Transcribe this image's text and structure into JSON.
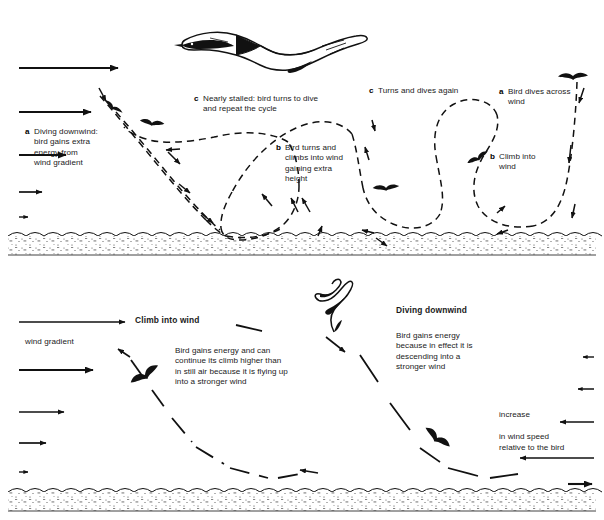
{
  "figure": {
    "title_implicit": "Dynamic soaring of an albatross",
    "ink_color": "#111111",
    "background_color": "#ffffff",
    "panels": [
      {
        "id": "top-panel",
        "name": "dynamic-soaring-cycle",
        "labels": [
          {
            "key": "a",
            "text": "Diving downwind:\nbird gains extra\nenergy from\nwind gradient"
          },
          {
            "key": "c",
            "text": "Nearly stalled: bird turns to dive\nand repeat the cycle"
          },
          {
            "key": "b",
            "text": "Bird turns and\nclimbs into wind\ngaining extra\nheight"
          },
          {
            "key": "c",
            "text": "Turns and dives again"
          },
          {
            "key": "a",
            "text": "Bird dives across\nwind"
          },
          {
            "key": "b",
            "text": "Climb into\nwind"
          }
        ],
        "wind_gradient_arrows": [
          {
            "length_px": 106,
            "label": "strongest wind"
          },
          {
            "length_px": 78,
            "label": ""
          },
          {
            "length_px": 53,
            "label": ""
          },
          {
            "length_px": 28,
            "label": ""
          },
          {
            "length_px": 11,
            "label": "weakest wind near surface"
          }
        ]
      },
      {
        "id": "bottom-panel",
        "name": "wind-gradient-explanation",
        "labels": [
          {
            "heading": "Climb into wind",
            "text": "Bird gains energy and can\ncontinue its climb higher than\nin still air because it is flying up\ninto a stronger wind"
          },
          {
            "heading": "Diving downwind",
            "text": "Bird gains energy\nbecause in effect it is\ndescending into a\nstronger wind"
          }
        ],
        "gradient_caption": "wind gradient",
        "relative_wind_caption": "increase\nin wind speed\nrelative to the bird",
        "relative_wind_caption_lines": [
          "increase",
          "in wind speed",
          "relative to the bird"
        ],
        "wind_gradient_arrows": [
          {
            "length_px": 106
          },
          {
            "length_px": 78
          },
          {
            "length_px": 53
          },
          {
            "length_px": 28
          },
          {
            "length_px": 11
          }
        ],
        "relative_wind_arrows": [
          {
            "length_px": 10
          },
          {
            "length_px": 14
          },
          {
            "length_px": 30
          },
          {
            "length_px": 56
          },
          {
            "length_px": 22,
            "direction": "right"
          }
        ]
      }
    ]
  }
}
